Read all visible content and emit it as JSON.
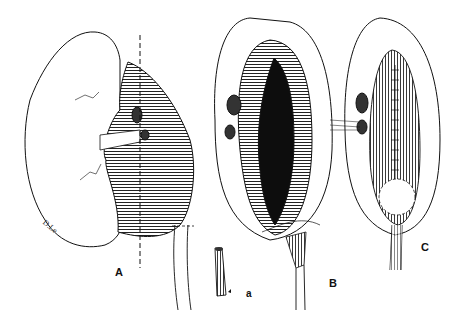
{
  "figure": {
    "panels": [
      {
        "id": "A",
        "label": "A",
        "description": "Kidney with dilated renal pelvis; dashed line marks incision plane",
        "x": 119,
        "y": 274
      },
      {
        "id": "a",
        "label": "a",
        "description": "Spatulated ureter end",
        "x": 249,
        "y": 296
      },
      {
        "id": "B",
        "label": "B",
        "description": "Opened renal pelvis with ureter being anastomosed",
        "x": 333,
        "y": 285
      },
      {
        "id": "C",
        "label": "C",
        "description": "Completed pyeloplasty with sutured pelvis and ureter",
        "x": 425,
        "y": 249
      }
    ],
    "signature": "D.Le",
    "colors": {
      "ink": "#111111",
      "background": "#ffffff"
    }
  }
}
